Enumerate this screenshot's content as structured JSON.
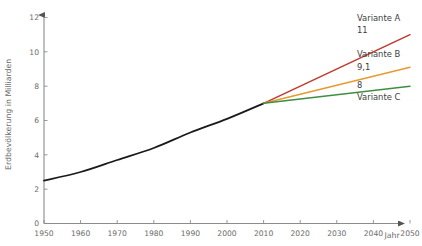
{
  "chart_data": {
    "type": "line",
    "title": "",
    "xlabel": "Jahr",
    "ylabel": "Erdbevölkerung in Milliarden",
    "xlim": [
      1950,
      2050
    ],
    "ylim": [
      0,
      12
    ],
    "xticks": [
      "1950",
      "1960",
      "1970",
      "1980",
      "1990",
      "2000",
      "2010",
      "2020",
      "2030",
      "2040",
      "2050"
    ],
    "yticks": [
      "0",
      "2",
      "4",
      "6",
      "8",
      "10",
      "12"
    ],
    "grid": false,
    "legend_position": "inline-right-labels",
    "series": [
      {
        "name": "Historisch",
        "color": "#1a1a1a",
        "x": [
          1950,
          1960,
          1970,
          1980,
          1990,
          2000,
          2010
        ],
        "values": [
          2.5,
          3.0,
          3.7,
          4.4,
          5.3,
          6.1,
          7.0
        ]
      },
      {
        "name": "Variante A",
        "color": "#c0392b",
        "x": [
          2010,
          2050
        ],
        "values": [
          7.0,
          11.0
        ],
        "end_label": "11"
      },
      {
        "name": "Variante B",
        "color": "#e69a2e",
        "x": [
          2010,
          2050
        ],
        "values": [
          7.0,
          9.1
        ],
        "end_label": "9,1"
      },
      {
        "name": "Variante C",
        "color": "#3e8e41",
        "x": [
          2010,
          2050
        ],
        "values": [
          7.0,
          8.0
        ],
        "end_label": "8"
      }
    ],
    "annotations": [
      {
        "name": "Variante A",
        "value": "11"
      },
      {
        "name": "Variante B",
        "value": "9,1"
      },
      {
        "name": "Variante C",
        "value": "8"
      }
    ]
  }
}
